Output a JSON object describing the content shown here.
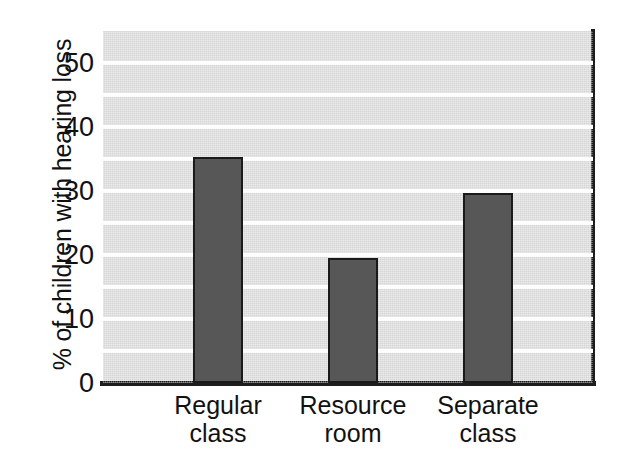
{
  "chart_data": {
    "type": "bar",
    "title": "",
    "xlabel": "",
    "ylabel": "% of children with hearing loss",
    "categories": [
      "Regular class",
      "Resource room",
      "Separate class"
    ],
    "category_lines": [
      [
        "Regular",
        "class"
      ],
      [
        "Resource",
        "room"
      ],
      [
        "Separate",
        "class"
      ]
    ],
    "values": [
      35.3,
      19.5,
      29.7
    ],
    "ylim": [
      0,
      55
    ],
    "yticks": [
      0,
      10,
      20,
      30,
      40,
      50
    ],
    "ytick_labels": [
      "0",
      "10",
      "20",
      "30",
      "40",
      "50"
    ],
    "gridlines": [
      5,
      10,
      15,
      20,
      25,
      30,
      35,
      40,
      45,
      50
    ],
    "grid": true,
    "grid_color": "#fdfdfd",
    "legend": "none",
    "bar_color": "#575757",
    "bar_edge_color": "#1a1a1a",
    "plot_background": "#d6d6d6",
    "axis_color": "#1d1d1d",
    "figure_background": "#ffffff"
  }
}
